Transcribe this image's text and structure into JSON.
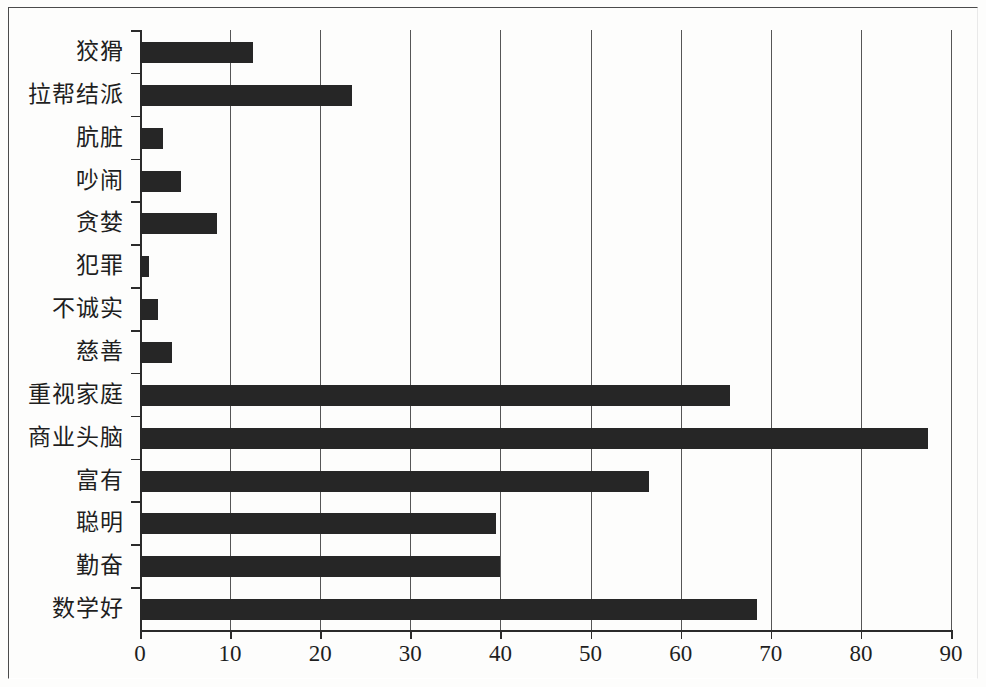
{
  "chart_data": {
    "type": "bar",
    "orientation": "horizontal",
    "title": "",
    "xlabel": "",
    "ylabel": "",
    "xlim": [
      0,
      90
    ],
    "xticks": [
      0,
      10,
      20,
      30,
      40,
      50,
      60,
      70,
      80,
      90
    ],
    "grid": "vertical",
    "legend": "none",
    "bar_color": "#262626",
    "categories": [
      "狡猾",
      "拉帮结派",
      "肮脏",
      "吵闹",
      "贪婪",
      "犯罪",
      "不诚实",
      "慈善",
      "重视家庭",
      "商业头脑",
      "富有",
      "聪明",
      "勤奋",
      "数学好"
    ],
    "values": [
      12.5,
      23.5,
      2.5,
      4.5,
      8.5,
      1,
      2,
      3.5,
      65.5,
      87.5,
      56.5,
      39.5,
      40,
      68.5
    ]
  }
}
